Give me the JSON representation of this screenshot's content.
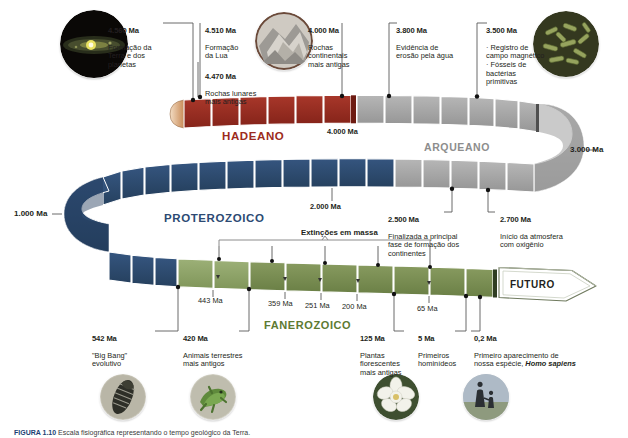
{
  "figure": {
    "caption_label": "FIGURA 1.10",
    "caption_rest": " Escala fisiográfica representando o tempo geológico da Terra."
  },
  "eras": [
    {
      "id": "hadeano",
      "name": "HADEANO",
      "color": "#9c2b20",
      "band_color": "#9a2b1e"
    },
    {
      "id": "arqueano",
      "name": "ARQUEANO",
      "color": "#8d8d8d",
      "band_color": "#a8a8a8"
    },
    {
      "id": "proterozoico",
      "name": "PROTEROZOICO",
      "color": "#2c4a73",
      "band_color": "#2e4d78"
    },
    {
      "id": "fanerozoico",
      "name": "FANEROZOICO",
      "color": "#5d7a32",
      "band_color": "#7e9456"
    }
  ],
  "scale_marks": [
    {
      "id": "3000ma",
      "label": "3.000 Ma"
    },
    {
      "id": "1000ma",
      "label": "1.000 Ma"
    }
  ],
  "future": {
    "label": "FUTURO"
  },
  "extinctions": {
    "label": "Extinções em massa"
  },
  "band_ticks": [
    {
      "id": "t4000",
      "label": "4.000 Ma",
      "bold": true
    },
    {
      "id": "t2000",
      "label": "2.000 Ma",
      "bold": true
    },
    {
      "id": "t443",
      "label": "443 Ma",
      "bold": false
    },
    {
      "id": "t359",
      "label": "359 Ma",
      "bold": false
    },
    {
      "id": "t251",
      "label": "251 Ma",
      "bold": false
    },
    {
      "id": "t200",
      "label": "200 Ma",
      "bold": false
    },
    {
      "id": "t65",
      "label": "65 Ma",
      "bold": false
    }
  ],
  "annotations_top": [
    {
      "id": "a4560",
      "ma": "4.560 Ma",
      "desc": "Formação da\nTerra e dos\nplanetas"
    },
    {
      "id": "a4510",
      "ma": "4.510 Ma",
      "desc": "Formação\nda Lua",
      "ma2": "4.470 Ma",
      "desc2": "Rochas lunares\nmais antigas"
    },
    {
      "id": "a4000",
      "ma": "4.000 Ma",
      "desc": "Rochas\ncontinentais\nmais antigas"
    },
    {
      "id": "a3800",
      "ma": "3.800 Ma",
      "desc": "Evidência de\nerosão pela água"
    },
    {
      "id": "a3500",
      "ma": "3.500 Ma",
      "desc": "· Registro de\ncampo magnético\n· Fósseis de\nbactérias\nprimitivas"
    }
  ],
  "annotations_mid": [
    {
      "id": "a2500",
      "ma": "2.500 Ma",
      "desc": "Finalizada a principal\nfase de formação dos\ncontinentes"
    },
    {
      "id": "a2700",
      "ma": "2.700 Ma",
      "desc": "Início da atmosfera\ncom oxigênio"
    }
  ],
  "annotations_bottom": [
    {
      "id": "a542",
      "ma": "542 Ma",
      "desc": "\"Big Bang\"\nevolutivo"
    },
    {
      "id": "a420",
      "ma": "420 Ma",
      "desc": "Animais terrestres\nmais antigos"
    },
    {
      "id": "a125",
      "ma": "125 Ma",
      "desc": "Plantas\nflorescentes\nmais antigas"
    },
    {
      "id": "a5",
      "ma": "5 Ma",
      "desc": "Primeiros\nhominídeos"
    },
    {
      "id": "a02",
      "ma": "0,2 Ma",
      "desc": "Primeiro aparecimento de\nnossa espécie, ",
      "species": "Homo sapiens"
    }
  ],
  "photos": [
    {
      "id": "protoplanetary-disk",
      "alt": "disco protoplanetário"
    },
    {
      "id": "lunar-rock",
      "alt": "rochas"
    },
    {
      "id": "bacteria",
      "alt": "bactérias primitivas"
    },
    {
      "id": "trilobite",
      "alt": "trilobita"
    },
    {
      "id": "amphibian",
      "alt": "animal terrestre"
    },
    {
      "id": "magnolia",
      "alt": "planta florescente"
    },
    {
      "id": "humans",
      "alt": "humanos"
    }
  ]
}
